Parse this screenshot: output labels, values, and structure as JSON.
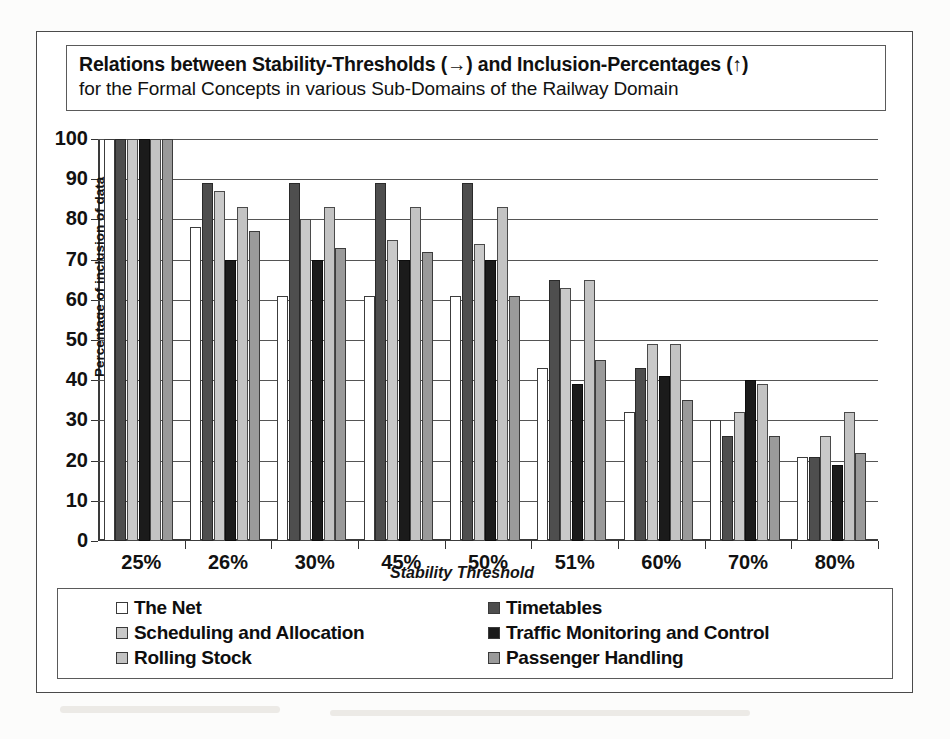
{
  "title": {
    "line1": "Relations between Stability-Thresholds (→) and Inclusion-Percentages (↑)",
    "line2": "for the Formal Concepts in various Sub-Domains of the Railway Domain"
  },
  "axis": {
    "y_title": "Percentage of inclusion of data",
    "x_title": "Stability Threshold"
  },
  "legend": {
    "items": [
      {
        "label": "The Net",
        "swatch": "#ffffff",
        "swatch_name": "legend-swatch-the-net"
      },
      {
        "label": "Timetables",
        "swatch": "#4e4e4e",
        "swatch_name": "legend-swatch-timetables"
      },
      {
        "label": "Scheduling and Allocation",
        "swatch": "#c9c9c9",
        "swatch_name": "legend-swatch-scheduling-and-allocation"
      },
      {
        "label": "Traffic Monitoring and Control",
        "swatch": "#1b1b1b",
        "swatch_name": "legend-swatch-traffic-monitoring-and-control"
      },
      {
        "label": "Rolling Stock",
        "swatch": "#c3c3c3",
        "swatch_name": "legend-swatch-rolling-stock"
      },
      {
        "label": "Passenger Handling",
        "swatch": "#9a9a9a",
        "swatch_name": "legend-swatch-passenger-handling"
      }
    ]
  },
  "chart_data": {
    "type": "bar",
    "title": "Relations between Stability-Thresholds (→) and Inclusion-Percentages (↑) for the Formal Concepts in various Sub-Domains of the Railway Domain",
    "xlabel": "Stability Threshold",
    "ylabel": "Percentage of inclusion of data",
    "ylim": [
      0,
      100
    ],
    "yticks": [
      0,
      10,
      20,
      30,
      40,
      50,
      60,
      70,
      80,
      90,
      100
    ],
    "grid": true,
    "legend_position": "bottom",
    "categories": [
      "25%",
      "26%",
      "30%",
      "45%",
      "50%",
      "51%",
      "60%",
      "70%",
      "80%"
    ],
    "series": [
      {
        "name": "The Net",
        "color": "#ffffff",
        "values": [
          100,
          78,
          61,
          61,
          61,
          43,
          32,
          30,
          21
        ]
      },
      {
        "name": "Timetables",
        "color": "#4e4e4e",
        "values": [
          100,
          89,
          89,
          89,
          89,
          65,
          43,
          26,
          21
        ]
      },
      {
        "name": "Scheduling and Allocation",
        "color": "#c9c9c9",
        "values": [
          100,
          87,
          80,
          75,
          74,
          63,
          49,
          32,
          26
        ]
      },
      {
        "name": "Traffic Monitoring and Control",
        "color": "#1b1b1b",
        "values": [
          100,
          70,
          70,
          70,
          70,
          39,
          41,
          40,
          19
        ]
      },
      {
        "name": "Rolling Stock",
        "color": "#c3c3c3",
        "values": [
          100,
          83,
          83,
          83,
          83,
          65,
          49,
          39,
          32
        ]
      },
      {
        "name": "Passenger Handling",
        "color": "#9a9a9a",
        "values": [
          100,
          77,
          73,
          72,
          61,
          45,
          35,
          26,
          22
        ]
      }
    ]
  }
}
